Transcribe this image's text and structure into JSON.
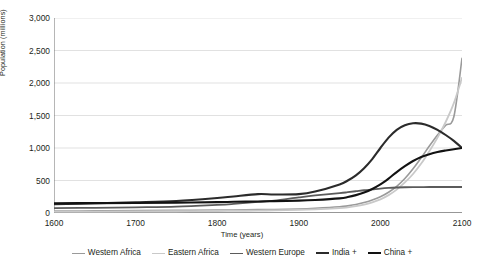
{
  "chart_data": {
    "type": "line",
    "title": "",
    "xlabel": "Time (years)",
    "ylabel": "Population (millions)",
    "xlim": [
      1600,
      2100
    ],
    "ylim": [
      0,
      3000
    ],
    "grid": true,
    "legend_position": "bottom",
    "x_ticks": [
      "1600",
      "1700",
      "1800",
      "1900",
      "2000",
      "2100"
    ],
    "x_tick_values": [
      1600,
      1700,
      1800,
      1900,
      2000,
      2100
    ],
    "y_ticks": [
      "0",
      "500",
      "1,000",
      "1,500",
      "2,000",
      "2,500",
      "3,000"
    ],
    "y_tick_values": [
      0,
      500,
      1000,
      1500,
      2000,
      2500,
      3000
    ],
    "x": [
      1600,
      1650,
      1700,
      1750,
      1800,
      1820,
      1850,
      1870,
      1900,
      1920,
      1950,
      1960,
      1970,
      1980,
      1990,
      2000,
      2010,
      2020,
      2030,
      2040,
      2050,
      2060,
      2070,
      2080,
      2090,
      2100
    ],
    "series": [
      {
        "name": "Western Africa",
        "color": "#9a9a9a",
        "width": 1.6,
        "values": [
          30,
          33,
          36,
          40,
          45,
          47,
          52,
          55,
          62,
          72,
          95,
          110,
          130,
          160,
          200,
          250,
          320,
          410,
          530,
          680,
          850,
          1030,
          1200,
          1350,
          1480,
          2380
        ]
      },
      {
        "name": "Eastern Africa",
        "color": "#c9c9c9",
        "width": 1.8,
        "values": [
          20,
          22,
          24,
          27,
          31,
          33,
          37,
          40,
          47,
          56,
          75,
          88,
          105,
          130,
          165,
          210,
          275,
          360,
          470,
          600,
          760,
          950,
          1160,
          1400,
          1690,
          2080
        ]
      },
      {
        "name": "Western Europe",
        "color": "#5b5b5b",
        "width": 1.8,
        "values": [
          74,
          80,
          88,
          98,
          125,
          140,
          170,
          190,
          240,
          270,
          305,
          320,
          335,
          350,
          362,
          375,
          385,
          392,
          396,
          398,
          399,
          400,
          400,
          400,
          400,
          400
        ]
      },
      {
        "name": "India +",
        "color": "#2b2b2b",
        "width": 2.1,
        "values": [
          135,
          150,
          165,
          185,
          230,
          255,
          290,
          285,
          290,
          330,
          440,
          500,
          580,
          690,
          830,
          1000,
          1160,
          1280,
          1350,
          1380,
          1375,
          1340,
          1280,
          1200,
          1110,
          1000
        ]
      },
      {
        "name": "China +",
        "color": "#121212",
        "width": 2.1,
        "values": [
          150,
          152,
          155,
          160,
          168,
          172,
          178,
          182,
          190,
          200,
          225,
          245,
          275,
          315,
          370,
          440,
          530,
          630,
          720,
          800,
          862,
          905,
          938,
          962,
          982,
          1000
        ]
      }
    ]
  },
  "legend": {
    "items": [
      {
        "label": "Western Africa",
        "color": "#9a9a9a",
        "width": 1.6
      },
      {
        "label": "Eastern Africa",
        "color": "#c9c9c9",
        "width": 1.8
      },
      {
        "label": "Western Europe",
        "color": "#5b5b5b",
        "width": 1.8
      },
      {
        "label": "India +",
        "color": "#2b2b2b",
        "width": 2.1
      },
      {
        "label": "China +",
        "color": "#121212",
        "width": 2.1
      }
    ]
  },
  "axes": {
    "y_title": "Population (millions)",
    "x_title": "Time (years)"
  },
  "style": {
    "background": "#ffffff",
    "axis_color": "#6f6f6f",
    "grid_color": "#d4d4d4",
    "text_color": "#231f20"
  }
}
